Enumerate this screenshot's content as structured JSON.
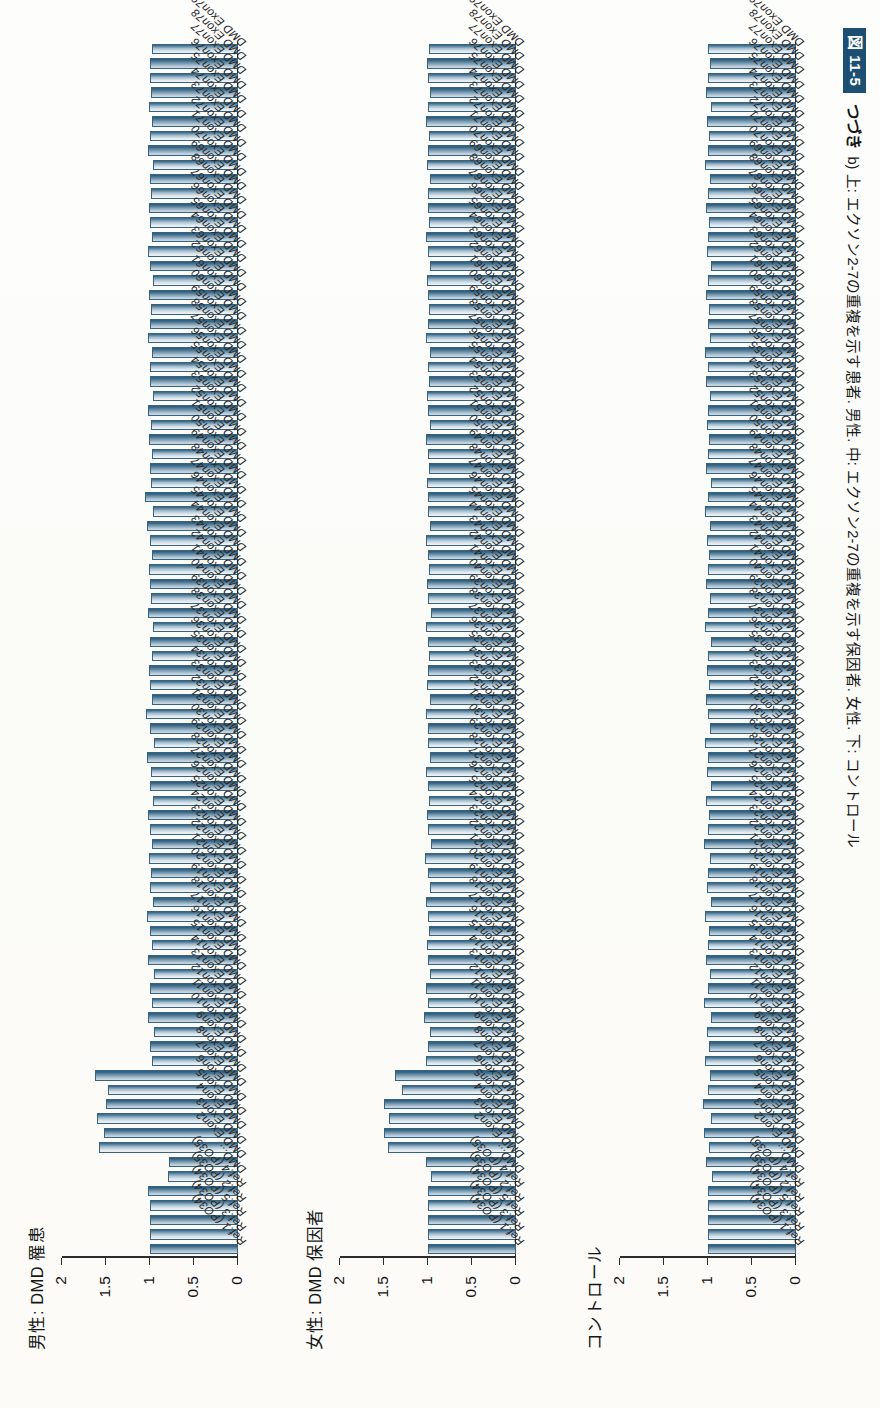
{
  "figure": {
    "number_badge": "図 11-5",
    "continued_label": "つづき",
    "caption": "b) 上: エクソン2-7の重複を示す患者. 男性. 中: エクソン2-7の重複を示す保因者. 女性. 下: コントロール"
  },
  "chart_data": [
    {
      "type": "bar",
      "title": "男性: DMD 罹患",
      "xlabel": "",
      "ylabel": "",
      "ylim": [
        0,
        2
      ],
      "yticks": [
        0,
        0.5,
        1,
        1.5,
        2
      ],
      "ytick_labels": [
        "0",
        "0.5",
        "1",
        "1.5",
        "2"
      ],
      "grid": false,
      "legend": "none",
      "categories": [
        "Ref.1 (PO34)",
        "Ref.3 (PO34)",
        "Ref.5 (PO34)",
        "Ref.2 (PO35)",
        "Ref.4 (PO35)",
        "DMD...",
        "DMD Exon2",
        "DMD Exon3",
        "DMD Exon4",
        "DMD Exon5",
        "DMD Exon6",
        "DMD Exon7",
        "DMD Exon8",
        "DMD Exon9",
        "DMD Exon10",
        "DMD Exon11",
        "DMD Exon12",
        "DMD Exon13",
        "DMD Exon14",
        "DMD Exon15",
        "DMD Exon16",
        "DMD Exon17",
        "DMD Exon18",
        "DMD Exon19",
        "DMD Exon20",
        "DMD Exon21",
        "DMD Exon22",
        "DMD Exon23",
        "DMD Exon24",
        "DMD Exon25",
        "DMD Exon26",
        "DMD Exon27",
        "DMD Exon28",
        "DMD Exon29",
        "DMD Exon30",
        "DMD Exon31",
        "DMD Exon32",
        "DMD Exon33",
        "DMD Exon34",
        "DMD Exon35",
        "DMD Exon36",
        "DMD Exon37",
        "DMD Exon38",
        "DMD Exon39",
        "DMD Exon40",
        "DMD Exon41",
        "DMD Exon42",
        "DMD Exon43",
        "DMD Exon44",
        "DMD Exon45",
        "DMD Exon46",
        "DMD Exon47",
        "DMD Exon48",
        "DMD Exon49",
        "DMD Exon50",
        "DMD Exon51",
        "DMD Exon52",
        "DMD Exon53",
        "DMD Exon54",
        "DMD Exon55",
        "DMD Exon56",
        "DMD Exon57",
        "DMD Exon58",
        "DMD Exon59",
        "DMD Exon60",
        "DMD Exon61",
        "DMD Exon62",
        "DMD Exon63",
        "DMD Exon64",
        "DMD Exon65",
        "DMD Exon66",
        "DMD Exon67",
        "DMD Exon68",
        "DMD Exon69",
        "DMD Exon70",
        "DMD Exon71",
        "DMD Exon72",
        "DMD Exon73",
        "DMD Exon74",
        "DMD Exon75",
        "DMD Exon76",
        "DMD Exon77",
        "DMD Exon78",
        "DMD Exon79"
      ],
      "values": [
        1.0,
        1.0,
        1.0,
        1.0,
        1.02,
        0.8,
        0.78,
        1.58,
        1.52,
        1.6,
        1.5,
        1.48,
        1.62,
        0.98,
        1.0,
        0.96,
        1.02,
        0.98,
        1.0,
        0.96,
        1.02,
        0.98,
        1.0,
        1.03,
        0.97,
        1.0,
        0.99,
        1.01,
        0.98,
        1.0,
        1.02,
        0.97,
        1.0,
        0.99,
        1.03,
        0.96,
        1.0,
        1.05,
        0.98,
        1.0,
        1.01,
        0.98,
        1.0,
        0.97,
        1.02,
        0.99,
        1.0,
        1.01,
        0.98,
        1.0,
        1.03,
        0.97,
        1.06,
        0.99,
        1.0,
        0.98,
        1.01,
        0.99,
        1.02,
        0.97,
        1.0,
        1.0,
        0.98,
        1.02,
        1.0,
        0.99,
        1.01,
        0.97,
        1.0,
        1.02,
        0.98,
        1.0,
        1.01,
        0.99,
        1.0,
        0.97,
        1.02,
        1.0,
        0.98,
        1.01,
        0.99,
        1.0,
        1.0,
        0.98
      ]
    },
    {
      "type": "bar",
      "title": "女性: DMD 保因者",
      "xlabel": "",
      "ylabel": "",
      "ylim": [
        0,
        2
      ],
      "yticks": [
        0,
        0.5,
        1,
        1.5,
        2
      ],
      "ytick_labels": [
        "0",
        "0.5",
        "1",
        "1.5",
        "2"
      ],
      "grid": false,
      "legend": "none",
      "categories": [
        "Ref.1 (PO34)",
        "Ref.3 (PO34)",
        "Ref.5 (PO34)",
        "Ref.2 (PO35)",
        "Ref.4 (PO35)",
        "DMD...",
        "DMD Exon2",
        "DMD Exon3",
        "DMD Exon4",
        "DMD Exon5",
        "DMD Exon6",
        "DMD Exon7",
        "DMD Exon8",
        "DMD Exon9",
        "DMD Exon10",
        "DMD Exon11",
        "DMD Exon12",
        "DMD Exon13",
        "DMD Exon14",
        "DMD Exon15",
        "DMD Exon16",
        "DMD Exon17",
        "DMD Exon18",
        "DMD Exon19",
        "DMD Exon20",
        "DMD Exon21",
        "DMD Exon22",
        "DMD Exon23",
        "DMD Exon24",
        "DMD Exon25",
        "DMD Exon26",
        "DMD Exon27",
        "DMD Exon28",
        "DMD Exon29",
        "DMD Exon30",
        "DMD Exon31",
        "DMD Exon32",
        "DMD Exon33",
        "DMD Exon34",
        "DMD Exon35",
        "DMD Exon36",
        "DMD Exon37",
        "DMD Exon38",
        "DMD Exon39",
        "DMD Exon40",
        "DMD Exon41",
        "DMD Exon42",
        "DMD Exon43",
        "DMD Exon44",
        "DMD Exon45",
        "DMD Exon46",
        "DMD Exon47",
        "DMD Exon48",
        "DMD Exon49",
        "DMD Exon50",
        "DMD Exon51",
        "DMD Exon52",
        "DMD Exon53",
        "DMD Exon54",
        "DMD Exon55",
        "DMD Exon56",
        "DMD Exon57",
        "DMD Exon58",
        "DMD Exon59",
        "DMD Exon60",
        "DMD Exon61",
        "DMD Exon62",
        "DMD Exon63",
        "DMD Exon64",
        "DMD Exon65",
        "DMD Exon66",
        "DMD Exon67",
        "DMD Exon68",
        "DMD Exon69",
        "DMD Exon70",
        "DMD Exon71",
        "DMD Exon72",
        "DMD Exon73",
        "DMD Exon74",
        "DMD Exon75",
        "DMD Exon76",
        "DMD Exon77",
        "DMD Exon78",
        "DMD Exon79"
      ],
      "values": [
        1.0,
        1.0,
        1.0,
        1.0,
        1.0,
        0.97,
        1.02,
        1.45,
        1.5,
        1.44,
        1.5,
        1.3,
        1.38,
        1.02,
        1.0,
        0.98,
        1.04,
        1.0,
        1.02,
        0.98,
        1.0,
        1.01,
        0.99,
        1.0,
        1.02,
        0.98,
        1.0,
        1.03,
        0.97,
        1.0,
        1.01,
        0.99,
        1.0,
        1.02,
        0.98,
        1.0,
        1.0,
        1.02,
        0.98,
        1.01,
        1.0,
        0.99,
        1.0,
        1.02,
        0.97,
        1.0,
        1.01,
        0.99,
        1.0,
        1.02,
        0.98,
        1.0,
        1.0,
        1.01,
        0.99,
        1.0,
        1.02,
        0.98,
        1.0,
        1.01,
        0.99,
        1.0,
        0.98,
        1.02,
        1.0,
        0.99,
        1.0,
        1.01,
        0.98,
        1.0,
        1.02,
        0.99,
        1.0,
        1.0,
        0.98,
        1.01,
        1.0,
        0.99,
        1.02,
        1.0,
        0.98,
        1.0,
        1.01,
        0.99
      ]
    },
    {
      "type": "bar",
      "title": "コントロール",
      "xlabel": "",
      "ylabel": "",
      "ylim": [
        0,
        2
      ],
      "yticks": [
        0,
        0.5,
        1,
        1.5,
        2
      ],
      "ytick_labels": [
        "0",
        "0.5",
        "1",
        "1.5",
        "2"
      ],
      "grid": false,
      "legend": "none",
      "categories": [
        "Ref.1 (PO34)",
        "Ref.3 (PO34)",
        "Ref.5 (PO34)",
        "Ref.2 (PO35)",
        "Ref.4 (PO35)",
        "DMD...",
        "DMD Exon2",
        "DMD Exon3",
        "DMD Exon4",
        "DMD Exon5",
        "DMD Exon6",
        "DMD Exon7",
        "DMD Exon8",
        "DMD Exon9",
        "DMD Exon10",
        "DMD Exon11",
        "DMD Exon12",
        "DMD Exon13",
        "DMD Exon14",
        "DMD Exon15",
        "DMD Exon16",
        "DMD Exon17",
        "DMD Exon18",
        "DMD Exon19",
        "DMD Exon20",
        "DMD Exon21",
        "DMD Exon22",
        "DMD Exon23",
        "DMD Exon24",
        "DMD Exon25",
        "DMD Exon26",
        "DMD Exon27",
        "DMD Exon28",
        "DMD Exon29",
        "DMD Exon30",
        "DMD Exon31",
        "DMD Exon32",
        "DMD Exon33",
        "DMD Exon34",
        "DMD Exon35",
        "DMD Exon36",
        "DMD Exon37",
        "DMD Exon38",
        "DMD Exon39",
        "DMD Exon40",
        "DMD Exon41",
        "DMD Exon42",
        "DMD Exon43",
        "DMD Exon44",
        "DMD Exon45",
        "DMD Exon46",
        "DMD Exon47",
        "DMD Exon48",
        "DMD Exon49",
        "DMD Exon50",
        "DMD Exon51",
        "DMD Exon52",
        "DMD Exon53",
        "DMD Exon54",
        "DMD Exon55",
        "DMD Exon56",
        "DMD Exon57",
        "DMD Exon58",
        "DMD Exon59",
        "DMD Exon60",
        "DMD Exon61",
        "DMD Exon62",
        "DMD Exon63",
        "DMD Exon64",
        "DMD Exon65",
        "DMD Exon66",
        "DMD Exon67",
        "DMD Exon68",
        "DMD Exon69",
        "DMD Exon70",
        "DMD Exon71",
        "DMD Exon72",
        "DMD Exon73",
        "DMD Exon74",
        "DMD Exon75",
        "DMD Exon76",
        "DMD Exon77",
        "DMD Exon78",
        "DMD Exon79"
      ],
      "values": [
        1.0,
        1.0,
        1.0,
        1.0,
        1.0,
        0.96,
        1.02,
        0.99,
        1.04,
        0.97,
        1.06,
        1.0,
        0.98,
        1.03,
        0.99,
        1.01,
        0.97,
        1.05,
        1.0,
        0.98,
        1.02,
        1.0,
        0.99,
        1.03,
        0.97,
        1.01,
        1.0,
        0.98,
        1.04,
        1.0,
        0.99,
        1.02,
        0.97,
        1.01,
        1.0,
        1.03,
        0.98,
        1.0,
        1.02,
        0.99,
        1.01,
        1.0,
        0.97,
        1.03,
        1.0,
        0.98,
        1.02,
        1.0,
        0.99,
        1.01,
        0.98,
        1.03,
        1.0,
        0.97,
        1.02,
        1.0,
        0.99,
        1.01,
        1.0,
        0.98,
        1.02,
        1.0,
        1.03,
        0.98,
        1.0,
        0.99,
        1.02,
        1.0,
        0.97,
        1.01,
        1.0,
        0.99,
        1.02,
        1.0,
        0.98,
        1.03,
        1.0,
        0.99,
        1.01,
        0.97,
        1.02,
        1.0,
        0.98,
        1.0
      ]
    }
  ]
}
